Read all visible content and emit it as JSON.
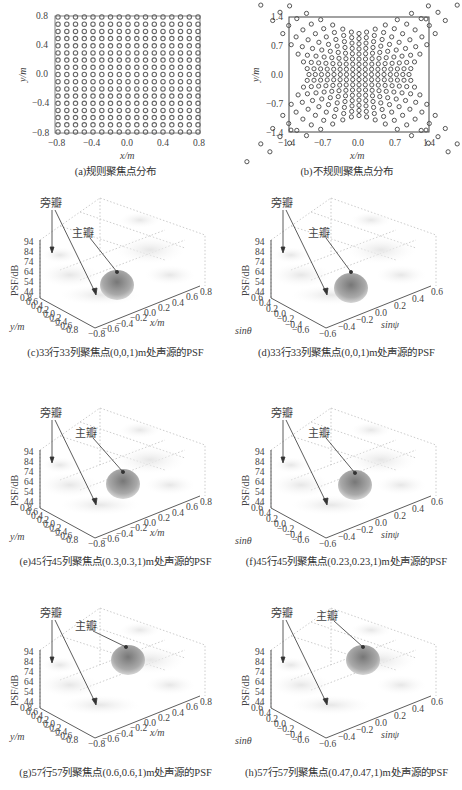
{
  "chart_data": [
    {
      "id": "a",
      "type": "scatter",
      "title": "(a)规则聚焦点分布",
      "xlabel": "x/m",
      "ylabel": "y/m",
      "xlim": [
        -0.8,
        0.8
      ],
      "ylim": [
        -0.8,
        0.8
      ],
      "xticks": [
        "-0.8",
        "-0.4",
        "0.0",
        "0.4",
        "0.8"
      ],
      "yticks": [
        "0.8",
        "0.4",
        "0.0",
        "-0.4",
        "-0.8"
      ],
      "grid_points": "17x17 regular grid from -0.8 to 0.8 step 0.1",
      "marker": "hollow circle"
    },
    {
      "id": "b",
      "type": "scatter",
      "title": "(b)不规则聚焦点分布",
      "xlabel": "x/m",
      "ylabel": "y/m",
      "xlim": [
        -1.4,
        1.4
      ],
      "ylim": [
        -1.4,
        1.4
      ],
      "xticks": [
        "-1.4",
        "-0.7",
        "0.0",
        "0.7",
        "1.4"
      ],
      "yticks": [
        "1.4",
        "0.7",
        "0.0",
        "-0.7",
        "-1.4"
      ],
      "grid_points": "irregular pincushion-shaped grid, dense at center, spreading toward corners",
      "marker": "hollow circle"
    },
    {
      "id": "c",
      "type": "surface",
      "title": "(c)33行33列聚焦点(0,0,1)m处声源的PSF",
      "zlabel": "PSF/dB",
      "xlabel": "x/m",
      "ylabel": "y/m",
      "zticks": [
        "94",
        "84",
        "74",
        "64",
        "54",
        "44"
      ],
      "yticks": [
        "0.8",
        "0.6",
        "0.4",
        "0.2",
        "0.0",
        "-0.2",
        "-0.4",
        "-0.6",
        "-0.8"
      ],
      "xticks": [
        "-0.8",
        "-0.6",
        "-0.4",
        "-0.2",
        "0.0",
        "0.2",
        "0.4",
        "0.6",
        "0.8"
      ],
      "annotations": [
        "旁瓣",
        "主瓣"
      ]
    },
    {
      "id": "d",
      "type": "surface",
      "title": "(d)33行33列聚焦点(0,0,1)m处声源的PSF",
      "zlabel": "PSF/dB",
      "xlabel": "sinψ",
      "ylabel": "sinθ",
      "zticks": [
        "94",
        "84",
        "74",
        "64",
        "54",
        "44"
      ],
      "yticks": [
        "0.6",
        "0.4",
        "0.2",
        "0.0",
        "-0.2",
        "-0.4",
        "-0.6"
      ],
      "xticks": [
        "-0.6",
        "-0.4",
        "-0.2",
        "0.0",
        "0.2",
        "0.4",
        "0.6"
      ],
      "annotations": [
        "旁瓣",
        "主瓣"
      ]
    },
    {
      "id": "e",
      "type": "surface",
      "title": "(e)45行45列聚焦点(0.3,0.3,1)m处声源的PSF",
      "zlabel": "PSF/dB",
      "xlabel": "x/m",
      "ylabel": "y/m",
      "zticks": [
        "94",
        "84",
        "74",
        "64",
        "54",
        "44"
      ],
      "yticks": [
        "0.8",
        "0.6",
        "0.4",
        "0.2",
        "0.0",
        "-0.2",
        "-0.4",
        "-0.6",
        "-0.8"
      ],
      "xticks": [
        "-0.8",
        "-0.6",
        "-0.4",
        "-0.2",
        "0.0",
        "0.2",
        "0.4",
        "0.6",
        "0.8"
      ],
      "annotations": [
        "旁瓣",
        "主瓣"
      ]
    },
    {
      "id": "f",
      "type": "surface",
      "title": "(f)45行45列聚焦点(0.23,0.23,1)m处声源的PSF",
      "zlabel": "PSF/dB",
      "xlabel": "sinψ",
      "ylabel": "sinθ",
      "zticks": [
        "94",
        "84",
        "74",
        "64",
        "54",
        "44"
      ],
      "yticks": [
        "0.6",
        "0.4",
        "0.2",
        "0.0",
        "-0.2",
        "-0.4",
        "-0.6"
      ],
      "xticks": [
        "-0.6",
        "-0.4",
        "-0.2",
        "0.0",
        "0.2",
        "0.4",
        "0.6"
      ],
      "annotations": [
        "旁瓣",
        "主瓣"
      ]
    },
    {
      "id": "g",
      "type": "surface",
      "title": "(g)57行57列聚焦点(0.6,0.6,1)m处声源的PSF",
      "zlabel": "PSF/dB",
      "xlabel": "x/m",
      "ylabel": "y/m",
      "zticks": [
        "94",
        "84",
        "74",
        "64",
        "54",
        "44"
      ],
      "yticks": [
        "0.8",
        "0.6",
        "0.4",
        "0.2",
        "0.0",
        "-0.2",
        "-0.4",
        "-0.6",
        "-0.8"
      ],
      "xticks": [
        "-0.8",
        "-0.6",
        "-0.4",
        "-0.2",
        "0.0",
        "0.2",
        "0.4",
        "0.6",
        "0.8"
      ],
      "annotations": [
        "旁瓣",
        "主瓣"
      ]
    },
    {
      "id": "h",
      "type": "surface",
      "title": "(h)57行57列聚焦点(0.47,0.47,1)m处声源的PSF",
      "zlabel": "PSF/dB",
      "xlabel": "sinψ",
      "ylabel": "sinθ",
      "zticks": [
        "94",
        "84",
        "74",
        "64",
        "54",
        "44"
      ],
      "yticks": [
        "0.6",
        "0.4",
        "0.2",
        "0.0",
        "-0.2",
        "-0.4",
        "-0.6"
      ],
      "xticks": [
        "-0.6",
        "-0.4",
        "-0.2",
        "0.0",
        "0.2",
        "0.4",
        "0.6"
      ],
      "annotations": [
        "旁瓣",
        "主瓣"
      ]
    }
  ],
  "panels": {
    "a": {
      "caption": "(a)规则聚焦点分布",
      "xlabel": "x/m",
      "ylabel": "y/m",
      "xticks": [
        "−0.8",
        "−0.4",
        "0.0",
        "0.4",
        "0.8"
      ],
      "yticks": [
        "0.8",
        "0.4",
        "0.0",
        "−0.4",
        "−0.8"
      ]
    },
    "b": {
      "caption": "(b)不规则聚焦点分布",
      "xlabel": "x/m",
      "ylabel": "y/m",
      "xticks": [
        "−1.4",
        "−0.7",
        "0.0",
        "0.7",
        "1.4"
      ],
      "yticks": [
        "1.4",
        "0.7",
        "0.0",
        "−0.7",
        "−1.4"
      ]
    },
    "c": {
      "caption": "(c)33行33列聚焦点(0,0,1)m处声源的PSF"
    },
    "d": {
      "caption": "(d)33行33列聚焦点(0,0,1)m处声源的PSF"
    },
    "e": {
      "caption": "(e)45行45列聚焦点(0.3,0.3,1)m处声源的PSF"
    },
    "f": {
      "caption": "(f)45行45列聚焦点(0.23,0.23,1)m处声源的PSF"
    },
    "g": {
      "caption": "(g)57行57列聚焦点(0.6,0.6,1)m处声源的PSF"
    },
    "h": {
      "caption": "(h)57行57列聚焦点(0.47,0.47,1)m处声源的PSF"
    }
  },
  "surface_labels": {
    "zlabel": "PSF/dB",
    "zticks": [
      "94",
      "84",
      "74",
      "64",
      "54",
      "44"
    ],
    "xy_ylabel": "y/m",
    "xy_xlabel": "x/m",
    "sin_ylabel": "sinθ",
    "sin_xlabel": "sinψ",
    "xy_yticks": [
      "0.8",
      "0.6",
      "0.4",
      "0.2",
      "0.0",
      "−0.2",
      "−0.4",
      "−0.6",
      "−0.8"
    ],
    "xy_xticks": [
      "−0.8",
      "−0.6",
      "−0.4",
      "−0.2",
      "0.0",
      "0.2",
      "0.4",
      "0.6",
      "0.8"
    ],
    "sin_yticks": [
      "0.6",
      "0.4",
      "0.2",
      "0.0",
      "−0.2",
      "−0.4",
      "−0.6"
    ],
    "sin_xticks": [
      "−0.6",
      "−0.4",
      "−0.2",
      "0.0",
      "0.2",
      "0.4",
      "0.6"
    ],
    "sidelobe": "旁瓣",
    "mainlobe": "主瓣"
  }
}
